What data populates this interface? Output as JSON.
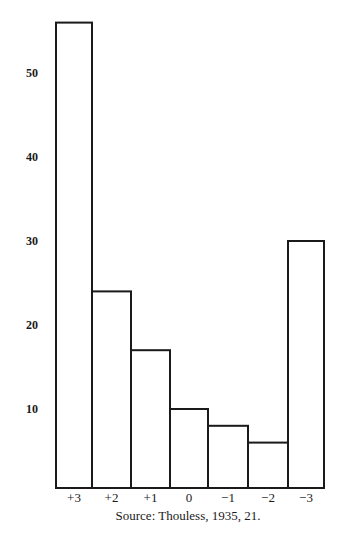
{
  "chart_data": {
    "type": "bar",
    "title": "",
    "xlabel": "",
    "ylabel": "",
    "categories": [
      "+3",
      "+2",
      "+1",
      "0",
      "−1",
      "−2",
      "−3"
    ],
    "values": [
      56,
      24,
      17,
      10,
      8,
      6,
      30
    ],
    "yticks": [
      10,
      20,
      30,
      40,
      50
    ],
    "ylim": [
      0,
      57
    ],
    "grid": false,
    "legend": null,
    "bar_style": "outlined, white fill, black stroke, adjacent (histogram)",
    "source": "Source: Thouless, 1935, 21."
  },
  "layout": {
    "plot_left": 56,
    "bar_widths": [
      36,
      39,
      39,
      38,
      40,
      40,
      36
    ],
    "zero_y": 493,
    "baseline_y": 488,
    "px_per_unit": 8.4,
    "colors": {
      "stroke": "#1a1a1a",
      "fill": "#ffffff",
      "background": "#ffffff"
    }
  }
}
